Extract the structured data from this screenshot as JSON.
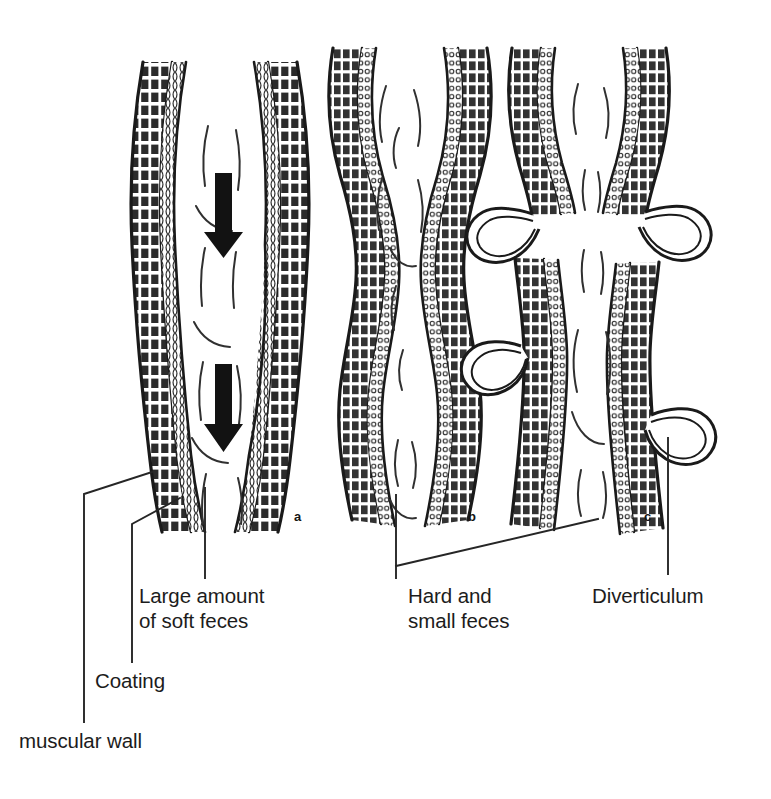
{
  "figure": {
    "background_color": "#ffffff",
    "ink_color": "#1a1a1a",
    "width": 771,
    "height": 799
  },
  "panels": [
    {
      "id": "a",
      "letter": "a",
      "name": "normal-colon-with-soft-feces",
      "description": "Normal colon segment with wide lumen, large amount of soft feces and downward propulsion arrows",
      "arrows": 2,
      "arrow_direction": "down"
    },
    {
      "id": "b",
      "letter": "b",
      "name": "constricted-colon-with-hard-feces",
      "description": "Colon segment with thickened muscular wall, narrowed segmented lumen and hard small feces",
      "arrows": 0,
      "arrow_direction": ""
    },
    {
      "id": "c",
      "letter": "c",
      "name": "colon-with-diverticula",
      "description": "Colon segment with diverticula herniating through the muscular wall",
      "arrows": 0,
      "arrow_direction": "",
      "diverticula_count": 4
    }
  ],
  "labels": [
    {
      "id": "large-feces",
      "text": "Large amount\nof soft feces",
      "points_to": "panel-a-lumen"
    },
    {
      "id": "coating",
      "text": "Coating",
      "points_to": "panel-a-mucosal-lining"
    },
    {
      "id": "muscular-wall",
      "text": "muscular wall",
      "points_to": "panel-a-outer-muscle-layer"
    },
    {
      "id": "hard-feces",
      "text": "Hard and\nsmall feces",
      "points_to": "panel-b-lumen-and-panel-c-lumen"
    },
    {
      "id": "diverticulum",
      "text": "Diverticulum",
      "points_to": "panel-c-outpouching"
    }
  ],
  "legend": {
    "wall_layers": [
      "muscular wall",
      "Coating"
    ]
  }
}
